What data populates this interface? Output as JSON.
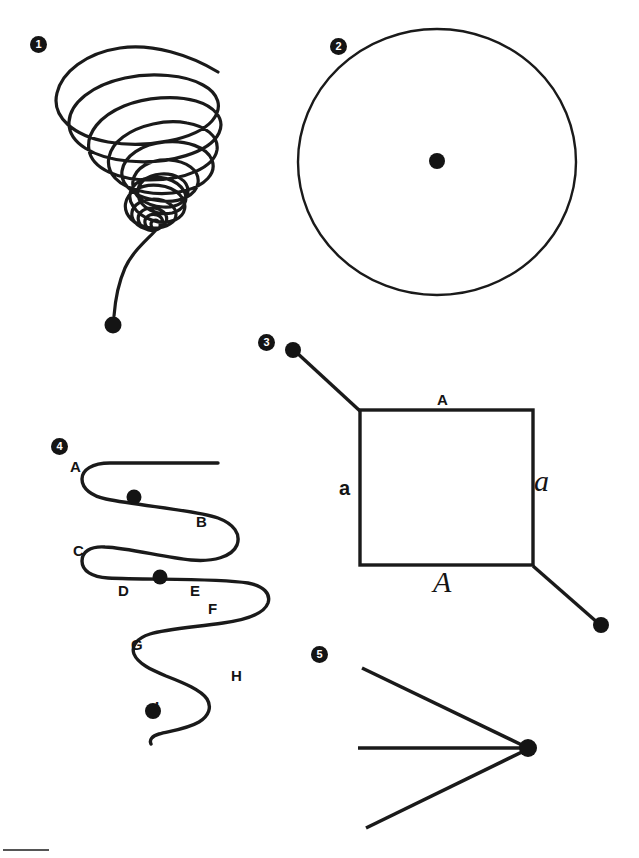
{
  "page": {
    "background_color": "#ffffff",
    "ink_color": "#1a1a1a",
    "width": 639,
    "height": 858
  },
  "figures": [
    {
      "number": "1",
      "marker_label": "1",
      "name": "conical-spiral",
      "description": "Descending conical spiral (tornado form) with free tail at upper right and terminal dot at bottom",
      "endpoint_dot": true
    },
    {
      "number": "2",
      "marker_label": "2",
      "name": "circle-with-center-dot",
      "description": "Closed circle with a single filled dot at its center",
      "endpoint_dot": true
    },
    {
      "number": "3",
      "marker_label": "3",
      "name": "labelled-square",
      "description": "Square with four side labels and two diagonal leader lines ending in dots",
      "endpoint_dot": true,
      "side_labels": {
        "top": "A",
        "left": "a",
        "right": "a",
        "bottom": "A"
      }
    },
    {
      "number": "4",
      "marker_label": "4",
      "name": "serpentine-curve",
      "description": "Serpentine switchback curve with lettered waypoints and two dots along the path plus a terminal dot",
      "endpoint_dot": true,
      "point_labels": [
        "A",
        "B",
        "C",
        "D",
        "E",
        "F",
        "G",
        "H",
        "I"
      ]
    },
    {
      "number": "5",
      "marker_label": "5",
      "name": "converging-lines",
      "description": "Three straight lines converging to a single filled dot at the right",
      "endpoint_dot": true
    }
  ],
  "figure4_labels": [
    {
      "text": "A",
      "x": 70,
      "y": 459
    },
    {
      "text": "B",
      "x": 196,
      "y": 514
    },
    {
      "text": "C",
      "x": 73,
      "y": 543
    },
    {
      "text": "D",
      "x": 118,
      "y": 583
    },
    {
      "text": "E",
      "x": 190,
      "y": 583
    },
    {
      "text": "F",
      "x": 208,
      "y": 601
    },
    {
      "text": "G",
      "x": 131,
      "y": 637
    },
    {
      "text": "H",
      "x": 231,
      "y": 668
    },
    {
      "text": "I",
      "x": 155,
      "y": 699
    }
  ],
  "figure3_side_labels": [
    {
      "key": "top",
      "text": "A",
      "style": "sans-bold",
      "x": 437,
      "y": 392
    },
    {
      "key": "left",
      "text": "a",
      "style": "sans-bold-lower",
      "x": 339,
      "y": 478
    },
    {
      "key": "right",
      "text": "a",
      "style": "script-lower",
      "x": 534,
      "y": 466
    },
    {
      "key": "bottom",
      "text": "A",
      "style": "script-upper",
      "x": 433,
      "y": 567
    }
  ],
  "markers": [
    {
      "label": "1",
      "x": 30,
      "y": 36
    },
    {
      "label": "2",
      "x": 330,
      "y": 38
    },
    {
      "label": "3",
      "x": 258,
      "y": 334
    },
    {
      "label": "4",
      "x": 51,
      "y": 438
    },
    {
      "label": "5",
      "x": 311,
      "y": 646
    }
  ],
  "footer": {
    "rule_visible": true
  }
}
